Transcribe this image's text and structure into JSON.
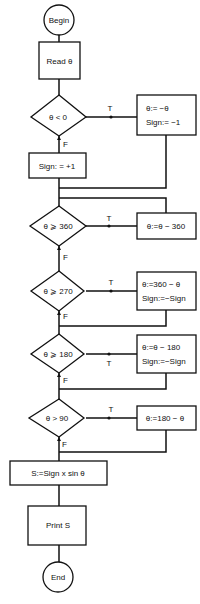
{
  "diagram": {
    "type": "flowchart",
    "title": "",
    "stroke_color": "#111111",
    "background": "#ffffff",
    "nodes": {
      "begin": {
        "shape": "terminal",
        "label": "Begin"
      },
      "read": {
        "shape": "process",
        "label": "Read θ"
      },
      "d1": {
        "shape": "decision",
        "label": "θ < 0"
      },
      "p1": {
        "shape": "process",
        "line1": "θ:= −θ",
        "line2": "Sign:=  −1"
      },
      "sign_pos": {
        "shape": "process",
        "label": "Sign: = +1"
      },
      "d2": {
        "shape": "decision",
        "label": "θ ⩾ 360"
      },
      "p2": {
        "shape": "process",
        "label": "θ:=θ − 360"
      },
      "d3": {
        "shape": "decision",
        "label": "θ ⩾ 270"
      },
      "p3": {
        "shape": "process",
        "line1": "θ:=360 − θ",
        "line2": "Sign:=−Sign"
      },
      "d4": {
        "shape": "decision",
        "label": "θ ⩾ 180"
      },
      "p4": {
        "shape": "process",
        "line1": "θ:=θ − 180",
        "line2": "Sign:=−Sign"
      },
      "d5": {
        "shape": "decision",
        "label": "θ > 90"
      },
      "p5": {
        "shape": "process",
        "label": "θ:=180 − θ"
      },
      "calc": {
        "shape": "process",
        "label": "S:=Sign x sin θ"
      },
      "print": {
        "shape": "process",
        "label": "Print S"
      },
      "end": {
        "shape": "terminal",
        "label": "End"
      }
    },
    "edge_labels": {
      "true": "T",
      "false": "F"
    },
    "edges": [
      {
        "from": "begin",
        "to": "read"
      },
      {
        "from": "read",
        "to": "d1"
      },
      {
        "from": "d1",
        "to": "p1",
        "label": "T"
      },
      {
        "from": "d1",
        "to": "sign_pos",
        "label": "F"
      },
      {
        "from": "p1",
        "to": "d2"
      },
      {
        "from": "sign_pos",
        "to": "d2"
      },
      {
        "from": "d2",
        "to": "p2",
        "label": "T"
      },
      {
        "from": "p2",
        "to": "d2"
      },
      {
        "from": "d2",
        "to": "d3",
        "label": "F"
      },
      {
        "from": "d3",
        "to": "p3",
        "label": "T"
      },
      {
        "from": "d3",
        "to": "d4",
        "label": "F"
      },
      {
        "from": "p3",
        "to": "d4"
      },
      {
        "from": "d4",
        "to": "p4",
        "label": "T"
      },
      {
        "from": "d4",
        "to": "d5",
        "label": "F"
      },
      {
        "from": "p4",
        "to": "d5"
      },
      {
        "from": "d5",
        "to": "p5",
        "label": "T"
      },
      {
        "from": "d5",
        "to": "calc",
        "label": "F"
      },
      {
        "from": "p5",
        "to": "calc"
      },
      {
        "from": "calc",
        "to": "print"
      },
      {
        "from": "print",
        "to": "end"
      }
    ]
  }
}
